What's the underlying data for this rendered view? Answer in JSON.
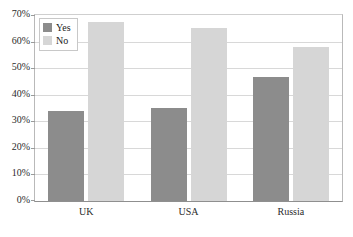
{
  "chart_data": {
    "type": "bar",
    "title": "",
    "xlabel": "",
    "ylabel": "",
    "categories": [
      "UK",
      "USA",
      "Russia"
    ],
    "series": [
      {
        "name": "Yes",
        "color": "#8c8c8c",
        "values": [
          34,
          35,
          46.5
        ]
      },
      {
        "name": "No",
        "color": "#d6d6d6",
        "values": [
          67.5,
          65,
          58
        ]
      }
    ],
    "ylim": [
      0,
      70
    ],
    "ytick_step": 10,
    "ytick_labels": [
      "0%",
      "10%",
      "20%",
      "30%",
      "40%",
      "50%",
      "60%",
      "70%"
    ],
    "ytick_values": [
      0,
      10,
      20,
      30,
      40,
      50,
      60,
      70
    ],
    "grid": true,
    "legend_position": "top-left-inside"
  },
  "legend": {
    "entries": [
      {
        "label": "Yes",
        "color": "#8c8c8c"
      },
      {
        "label": "No",
        "color": "#d6d6d6"
      }
    ]
  },
  "colors": {
    "yes": "#8c8c8c",
    "no": "#d6d6d6",
    "gridline": "#d8d8d8",
    "axis": "#8f8f8f",
    "text": "#2b2b2b",
    "background": "#ffffff"
  }
}
